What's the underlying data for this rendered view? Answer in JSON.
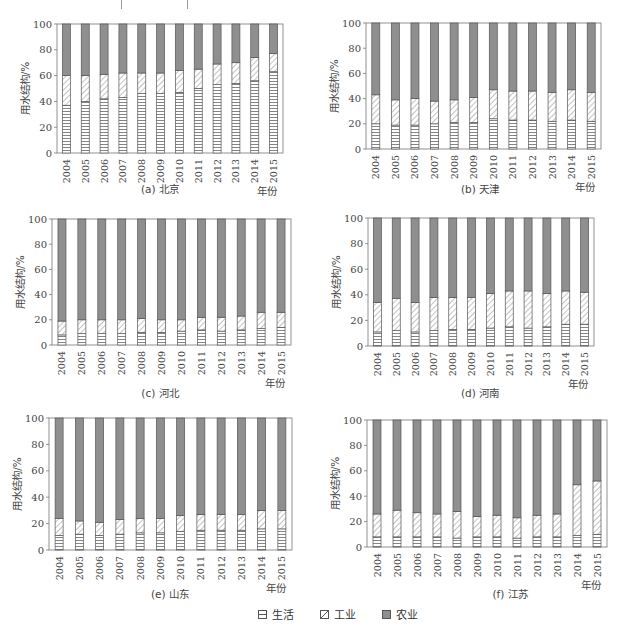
{
  "figure": {
    "legend": [
      {
        "key": "living",
        "label": "生活",
        "pattern": "horizontal-lines"
      },
      {
        "key": "industry",
        "label": "工业",
        "pattern": "diagonal-hatch"
      },
      {
        "key": "agriculture",
        "label": "农业",
        "pattern": "solid-gray"
      }
    ],
    "colors": {
      "agriculture": "#8f8f8f",
      "outline": "#555555",
      "pattern_line": "#666666",
      "axis": "#777777"
    }
  },
  "chart_data": [
    {
      "type": "bar",
      "stacked": true,
      "panel": "a",
      "title": "(a) 北京",
      "xlabel": "年份",
      "ylabel": "用水结构/%",
      "ylim": [
        0,
        100
      ],
      "yticks": [
        0,
        20,
        40,
        60,
        80,
        100
      ],
      "categories": [
        "2004",
        "2005",
        "2006",
        "2007",
        "2008",
        "2009",
        "2010",
        "2011",
        "2012",
        "2013",
        "2014",
        "2015"
      ],
      "series": [
        {
          "name": "生活",
          "values": [
            37,
            40,
            42,
            43,
            46,
            46,
            47,
            50,
            53,
            54,
            56,
            63
          ]
        },
        {
          "name": "工业",
          "values": [
            23,
            20,
            19,
            19,
            16,
            16,
            17,
            15,
            16,
            16,
            18,
            14
          ]
        },
        {
          "name": "农业",
          "values": [
            40,
            40,
            39,
            38,
            38,
            38,
            36,
            35,
            31,
            30,
            26,
            23
          ]
        }
      ]
    },
    {
      "type": "bar",
      "stacked": true,
      "panel": "b",
      "title": "(b) 天津",
      "xlabel": "年份",
      "ylabel": "用水结构/%",
      "ylim": [
        0,
        100
      ],
      "yticks": [
        0,
        20,
        40,
        60,
        80,
        100
      ],
      "categories": [
        "2004",
        "2005",
        "2006",
        "2007",
        "2008",
        "2009",
        "2010",
        "2011",
        "2012",
        "2013",
        "2014",
        "2015"
      ],
      "series": [
        {
          "name": "生活",
          "values": [
            20,
            19,
            19,
            20,
            21,
            21,
            24,
            23,
            23,
            22,
            23,
            22
          ]
        },
        {
          "name": "工业",
          "values": [
            23,
            20,
            21,
            18,
            18,
            20,
            23,
            23,
            23,
            23,
            24,
            23
          ]
        },
        {
          "name": "农业",
          "values": [
            57,
            61,
            60,
            62,
            61,
            59,
            53,
            54,
            54,
            55,
            53,
            55
          ]
        }
      ]
    },
    {
      "type": "bar",
      "stacked": true,
      "panel": "c",
      "title": "(c) 河北",
      "xlabel": "年份",
      "ylabel": "用水结构/%",
      "ylim": [
        0,
        100
      ],
      "yticks": [
        0,
        20,
        40,
        60,
        80,
        100
      ],
      "categories": [
        "2004",
        "2005",
        "2006",
        "2007",
        "2008",
        "2009",
        "2010",
        "2011",
        "2012",
        "2013",
        "2014",
        "2015"
      ],
      "series": [
        {
          "name": "生活",
          "values": [
            8,
            9,
            9,
            9,
            10,
            10,
            11,
            12,
            11,
            12,
            13,
            14
          ]
        },
        {
          "name": "工业",
          "values": [
            11,
            11,
            11,
            11,
            11,
            10,
            9,
            10,
            11,
            11,
            13,
            12
          ]
        },
        {
          "name": "农业",
          "values": [
            81,
            80,
            80,
            80,
            79,
            80,
            80,
            78,
            78,
            77,
            74,
            74
          ]
        }
      ]
    },
    {
      "type": "bar",
      "stacked": true,
      "panel": "d",
      "title": "(d) 河南",
      "xlabel": "年份",
      "ylabel": "用水结构/%",
      "ylim": [
        0,
        100
      ],
      "yticks": [
        0,
        20,
        40,
        60,
        80,
        100
      ],
      "categories": [
        "2004",
        "2005",
        "2006",
        "2007",
        "2008",
        "2009",
        "2010",
        "2011",
        "2012",
        "2013",
        "2014",
        "2015"
      ],
      "series": [
        {
          "name": "生活",
          "values": [
            11,
            12,
            11,
            12,
            13,
            13,
            14,
            15,
            14,
            15,
            17,
            17
          ]
        },
        {
          "name": "工业",
          "values": [
            23,
            25,
            23,
            26,
            25,
            25,
            27,
            28,
            29,
            26,
            26,
            25
          ]
        },
        {
          "name": "农业",
          "values": [
            66,
            63,
            66,
            62,
            62,
            62,
            59,
            57,
            57,
            59,
            57,
            58
          ]
        }
      ]
    },
    {
      "type": "bar",
      "stacked": true,
      "panel": "e",
      "title": "(e) 山东",
      "xlabel": "年份",
      "ylabel": "用水结构/%",
      "ylim": [
        0,
        100
      ],
      "yticks": [
        0,
        20,
        40,
        60,
        80,
        100
      ],
      "categories": [
        "2004",
        "2005",
        "2006",
        "2007",
        "2008",
        "2009",
        "2010",
        "2011",
        "2012",
        "2013",
        "2014",
        "2015"
      ],
      "series": [
        {
          "name": "生活",
          "values": [
            11,
            12,
            11,
            12,
            13,
            13,
            14,
            15,
            15,
            15,
            16,
            16
          ]
        },
        {
          "name": "工业",
          "values": [
            13,
            10,
            10,
            11,
            11,
            11,
            12,
            12,
            12,
            12,
            14,
            14
          ]
        },
        {
          "name": "农业",
          "values": [
            76,
            78,
            79,
            77,
            76,
            76,
            74,
            73,
            73,
            73,
            70,
            70
          ]
        }
      ]
    },
    {
      "type": "bar",
      "stacked": true,
      "panel": "f",
      "title": "(f) 江苏",
      "xlabel": "年份",
      "ylabel": "用水结构/%",
      "ylim": [
        0,
        100
      ],
      "yticks": [
        0,
        20,
        40,
        60,
        80,
        100
      ],
      "categories": [
        "2004",
        "2005",
        "2006",
        "2007",
        "2008",
        "2009",
        "2010",
        "2011",
        "2012",
        "2013",
        "2014",
        "2015"
      ],
      "series": [
        {
          "name": "生活",
          "values": [
            8,
            8,
            8,
            8,
            7,
            8,
            8,
            7,
            8,
            8,
            9,
            10
          ]
        },
        {
          "name": "工业",
          "values": [
            18,
            21,
            19,
            18,
            21,
            16,
            17,
            16,
            17,
            18,
            40,
            42
          ]
        },
        {
          "name": "农业",
          "values": [
            74,
            71,
            73,
            74,
            72,
            76,
            75,
            77,
            75,
            74,
            51,
            48
          ]
        }
      ]
    }
  ]
}
